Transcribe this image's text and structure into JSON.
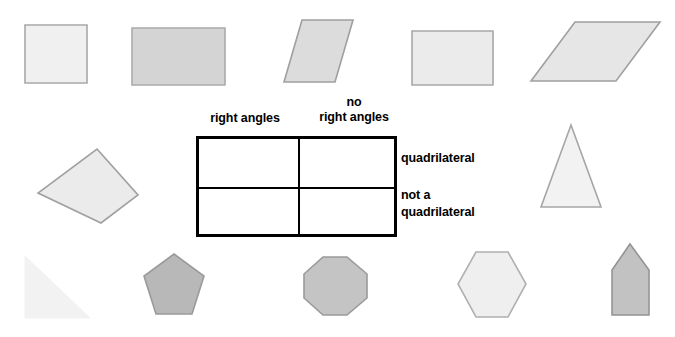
{
  "worksheet": {
    "title": "Quadrilateral sorting table with geometric shapes",
    "table": {
      "column_headers": [
        {
          "name": "right-angles",
          "line1": "right angles",
          "line2": ""
        },
        {
          "name": "no-right-angles",
          "line1": "no",
          "line2": "right angles"
        }
      ],
      "row_labels": [
        {
          "name": "quadrilateral",
          "line1": "quadrilateral",
          "line2": ""
        },
        {
          "name": "not-a-quadrilateral",
          "line1": "not a",
          "line2": "quadrilateral"
        }
      ],
      "cells": [
        {
          "name": "cell-quadrilateral-right-angles",
          "content": ""
        },
        {
          "name": "cell-quadrilateral-no-right-angles",
          "content": ""
        },
        {
          "name": "cell-not-quadrilateral-right-angles",
          "content": ""
        },
        {
          "name": "cell-not-quadrilateral-no-right-angles",
          "content": ""
        }
      ],
      "border_color": "#000000",
      "fill_color": "#ffffff"
    },
    "shapes": [
      {
        "name": "square",
        "label": "square",
        "fill": "#f0f0f0",
        "stroke": "#a8a8a8",
        "x": 24,
        "y": 24,
        "w": 64,
        "h": 60,
        "points": "1,1 63,1 63,59 1,59"
      },
      {
        "name": "rectangle-wide-gray",
        "label": "rectangle",
        "fill": "#d4d4d4",
        "stroke": "#aaaaaa",
        "x": 131,
        "y": 27,
        "w": 95,
        "h": 59,
        "points": "1,1 94,1 94,58 1,58"
      },
      {
        "name": "parallelogram-tall",
        "label": "parallelogram",
        "fill": "#dcdcdc",
        "stroke": "#9f9f9f",
        "x": 283,
        "y": 19,
        "w": 71,
        "h": 64,
        "points": "19,1 70,1 52,63 1,63"
      },
      {
        "name": "rectangle-light",
        "label": "rectangle",
        "fill": "#ebebeb",
        "stroke": "#a8a8a8",
        "x": 411,
        "y": 30,
        "w": 83,
        "h": 56,
        "points": "1,1 82,1 82,55 1,55"
      },
      {
        "name": "parallelogram-wide",
        "label": "parallelogram",
        "fill": "#e6e6e6",
        "stroke": "#a0a0a0",
        "x": 530,
        "y": 21,
        "w": 131,
        "h": 61,
        "points": "45,1 130,1 86,60 1,60"
      },
      {
        "name": "quadrilateral-irregular",
        "label": "irregular quadrilateral",
        "fill": "#ebebeb",
        "stroke": "#a0a0a0",
        "x": 37,
        "y": 148,
        "w": 102,
        "h": 76,
        "points": "60,1 101,47 64,75 1,45"
      },
      {
        "name": "triangle-isosceles",
        "label": "triangle",
        "fill": "#f2f2f2",
        "stroke": "#a6a6a6",
        "x": 540,
        "y": 124,
        "w": 62,
        "h": 84,
        "points": "31,1 61,83 1,83"
      },
      {
        "name": "triangle-right",
        "label": "right triangle",
        "fill": "#f2f2f2",
        "stroke": "#f2f2f2",
        "x": 24,
        "y": 255,
        "w": 67,
        "h": 64,
        "points": "1,1 1,63 66,63"
      },
      {
        "name": "pentagon-regular",
        "label": "pentagon",
        "fill": "#b8b8b8",
        "stroke": "#9a9a9a",
        "x": 143,
        "y": 253,
        "w": 62,
        "h": 62,
        "points": "31,1 61,23 49,61 13,61 1,23"
      },
      {
        "name": "octagon",
        "label": "octagon",
        "fill": "#c4c4c4",
        "stroke": "#9a9a9a",
        "x": 303,
        "y": 256,
        "w": 65,
        "h": 60,
        "points": "20,1 44,1 64,18 64,42 44,59 20,59 1,42 1,18"
      },
      {
        "name": "hexagon",
        "label": "hexagon",
        "fill": "#efefef",
        "stroke": "#b0b0b0",
        "x": 457,
        "y": 251,
        "w": 70,
        "h": 67,
        "points": "19,1 51,1 69,33 51,66 19,66 1,33"
      },
      {
        "name": "pentagon-house",
        "label": "house pentagon",
        "fill": "#c2c2c2",
        "stroke": "#949494",
        "x": 611,
        "y": 243,
        "w": 39,
        "h": 73,
        "points": "19,1 38,27 38,72 1,72 1,27"
      }
    ]
  }
}
